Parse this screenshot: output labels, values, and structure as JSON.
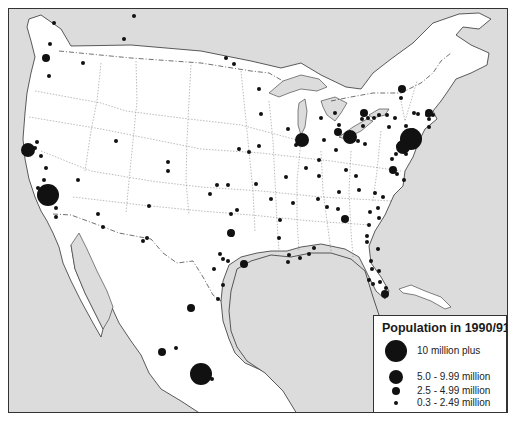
{
  "map": {
    "title": "North America city populations",
    "colors": {
      "water": "#dcdcdc",
      "land": "#ffffff",
      "lakes": "#dcdcdc",
      "city": "#111111",
      "border": "#333333"
    },
    "legend": {
      "title": "Population in 1990/91",
      "items": [
        {
          "label": "10 million plus",
          "radius": 11
        },
        {
          "label": "5.0 - 9.99 million",
          "radius": 7
        },
        {
          "label": "2.5 - 4.99 million",
          "radius": 4
        },
        {
          "label": "0.3 - 2.49 million",
          "radius": 2
        }
      ]
    },
    "cities": [
      {
        "x": 53,
        "y": 22,
        "r": 2
      },
      {
        "x": 49,
        "y": 43,
        "r": 2
      },
      {
        "x": 45,
        "y": 57,
        "r": 4
      },
      {
        "x": 82,
        "y": 62,
        "r": 2
      },
      {
        "x": 48,
        "y": 75,
        "r": 2
      },
      {
        "x": 123,
        "y": 38,
        "r": 2
      },
      {
        "x": 133,
        "y": 15,
        "r": 2
      },
      {
        "x": 233,
        "y": 63,
        "r": 2
      },
      {
        "x": 258,
        "y": 88,
        "r": 2
      },
      {
        "x": 258,
        "y": 145,
        "r": 2
      },
      {
        "x": 27,
        "y": 149,
        "r": 7
      },
      {
        "x": 36,
        "y": 141,
        "r": 2
      },
      {
        "x": 34,
        "y": 147,
        "r": 2
      },
      {
        "x": 40,
        "y": 155,
        "r": 2
      },
      {
        "x": 45,
        "y": 167,
        "r": 2
      },
      {
        "x": 43,
        "y": 179,
        "r": 2
      },
      {
        "x": 37,
        "y": 187,
        "r": 2
      },
      {
        "x": 47,
        "y": 194,
        "r": 11
      },
      {
        "x": 55,
        "y": 207,
        "r": 2
      },
      {
        "x": 55,
        "y": 216,
        "r": 2
      },
      {
        "x": 77,
        "y": 179,
        "r": 2
      },
      {
        "x": 115,
        "y": 140,
        "r": 2
      },
      {
        "x": 167,
        "y": 161,
        "r": 2
      },
      {
        "x": 167,
        "y": 170,
        "r": 2
      },
      {
        "x": 97,
        "y": 213,
        "r": 2
      },
      {
        "x": 102,
        "y": 226,
        "r": 2
      },
      {
        "x": 148,
        "y": 205,
        "r": 2
      },
      {
        "x": 146,
        "y": 237,
        "r": 2
      },
      {
        "x": 142,
        "y": 240,
        "r": 2
      },
      {
        "x": 227,
        "y": 184,
        "r": 2
      },
      {
        "x": 238,
        "y": 148,
        "r": 2
      },
      {
        "x": 248,
        "y": 151,
        "r": 2
      },
      {
        "x": 216,
        "y": 184,
        "r": 2
      },
      {
        "x": 209,
        "y": 193,
        "r": 2
      },
      {
        "x": 230,
        "y": 232,
        "r": 4
      },
      {
        "x": 222,
        "y": 258,
        "r": 2
      },
      {
        "x": 213,
        "y": 268,
        "r": 2
      },
      {
        "x": 243,
        "y": 263,
        "r": 4
      },
      {
        "x": 222,
        "y": 284,
        "r": 2
      },
      {
        "x": 217,
        "y": 298,
        "r": 2
      },
      {
        "x": 190,
        "y": 307,
        "r": 4
      },
      {
        "x": 175,
        "y": 347,
        "r": 2
      },
      {
        "x": 161,
        "y": 351,
        "r": 4
      },
      {
        "x": 200,
        "y": 373,
        "r": 11
      },
      {
        "x": 211,
        "y": 378,
        "r": 2
      },
      {
        "x": 225,
        "y": 57,
        "r": 2
      },
      {
        "x": 260,
        "y": 113,
        "r": 2
      },
      {
        "x": 255,
        "y": 183,
        "r": 2
      },
      {
        "x": 270,
        "y": 198,
        "r": 2
      },
      {
        "x": 285,
        "y": 176,
        "r": 2
      },
      {
        "x": 231,
        "y": 234,
        "r": 2
      },
      {
        "x": 278,
        "y": 237,
        "r": 2
      },
      {
        "x": 295,
        "y": 144,
        "r": 2
      },
      {
        "x": 305,
        "y": 167,
        "r": 2
      },
      {
        "x": 304,
        "y": 140,
        "r": 2
      },
      {
        "x": 301,
        "y": 139,
        "r": 7
      },
      {
        "x": 320,
        "y": 117,
        "r": 2
      },
      {
        "x": 287,
        "y": 128,
        "r": 2
      },
      {
        "x": 323,
        "y": 139,
        "r": 2
      },
      {
        "x": 318,
        "y": 159,
        "r": 2
      },
      {
        "x": 335,
        "y": 149,
        "r": 2
      },
      {
        "x": 334,
        "y": 112,
        "r": 2
      },
      {
        "x": 338,
        "y": 124,
        "r": 2
      },
      {
        "x": 337,
        "y": 131,
        "r": 4
      },
      {
        "x": 349,
        "y": 136,
        "r": 7
      },
      {
        "x": 362,
        "y": 125,
        "r": 2
      },
      {
        "x": 357,
        "y": 140,
        "r": 2
      },
      {
        "x": 364,
        "y": 143,
        "r": 2
      },
      {
        "x": 363,
        "y": 112,
        "r": 4
      },
      {
        "x": 367,
        "y": 117,
        "r": 2
      },
      {
        "x": 361,
        "y": 118,
        "r": 2
      },
      {
        "x": 373,
        "y": 117,
        "r": 2
      },
      {
        "x": 378,
        "y": 114,
        "r": 2
      },
      {
        "x": 386,
        "y": 114,
        "r": 2
      },
      {
        "x": 394,
        "y": 117,
        "r": 2
      },
      {
        "x": 400,
        "y": 97,
        "r": 2
      },
      {
        "x": 401,
        "y": 88,
        "r": 4
      },
      {
        "x": 413,
        "y": 112,
        "r": 2
      },
      {
        "x": 417,
        "y": 113,
        "r": 2
      },
      {
        "x": 426,
        "y": 114,
        "r": 2
      },
      {
        "x": 432,
        "y": 114,
        "r": 2
      },
      {
        "x": 428,
        "y": 126,
        "r": 2
      },
      {
        "x": 405,
        "y": 125,
        "r": 2
      },
      {
        "x": 388,
        "y": 126,
        "r": 2
      },
      {
        "x": 428,
        "y": 112,
        "r": 4
      },
      {
        "x": 428,
        "y": 118,
        "r": 2
      },
      {
        "x": 412,
        "y": 129,
        "r": 2
      },
      {
        "x": 410,
        "y": 138,
        "r": 11
      },
      {
        "x": 402,
        "y": 146,
        "r": 7
      },
      {
        "x": 397,
        "y": 145,
        "r": 2
      },
      {
        "x": 395,
        "y": 153,
        "r": 2
      },
      {
        "x": 391,
        "y": 158,
        "r": 2
      },
      {
        "x": 392,
        "y": 169,
        "r": 4
      },
      {
        "x": 405,
        "y": 153,
        "r": 2
      },
      {
        "x": 396,
        "y": 173,
        "r": 2
      },
      {
        "x": 318,
        "y": 175,
        "r": 2
      },
      {
        "x": 345,
        "y": 169,
        "r": 2
      },
      {
        "x": 355,
        "y": 175,
        "r": 2
      },
      {
        "x": 338,
        "y": 191,
        "r": 2
      },
      {
        "x": 358,
        "y": 189,
        "r": 2
      },
      {
        "x": 374,
        "y": 192,
        "r": 2
      },
      {
        "x": 382,
        "y": 196,
        "r": 2
      },
      {
        "x": 403,
        "y": 179,
        "r": 2
      },
      {
        "x": 344,
        "y": 218,
        "r": 4
      },
      {
        "x": 326,
        "y": 206,
        "r": 2
      },
      {
        "x": 317,
        "y": 198,
        "r": 2
      },
      {
        "x": 337,
        "y": 208,
        "r": 2
      },
      {
        "x": 377,
        "y": 207,
        "r": 2
      },
      {
        "x": 369,
        "y": 211,
        "r": 2
      },
      {
        "x": 368,
        "y": 224,
        "r": 2
      },
      {
        "x": 366,
        "y": 235,
        "r": 2
      },
      {
        "x": 366,
        "y": 241,
        "r": 2
      },
      {
        "x": 378,
        "y": 217,
        "r": 2
      },
      {
        "x": 279,
        "y": 219,
        "r": 2
      },
      {
        "x": 292,
        "y": 202,
        "r": 2
      },
      {
        "x": 288,
        "y": 254,
        "r": 2
      },
      {
        "x": 299,
        "y": 257,
        "r": 2
      },
      {
        "x": 308,
        "y": 253,
        "r": 2
      },
      {
        "x": 313,
        "y": 247,
        "r": 2
      },
      {
        "x": 287,
        "y": 261,
        "r": 2
      },
      {
        "x": 377,
        "y": 248,
        "r": 2
      },
      {
        "x": 370,
        "y": 260,
        "r": 2
      },
      {
        "x": 371,
        "y": 268,
        "r": 2
      },
      {
        "x": 378,
        "y": 270,
        "r": 2
      },
      {
        "x": 372,
        "y": 283,
        "r": 2
      },
      {
        "x": 379,
        "y": 281,
        "r": 2
      },
      {
        "x": 385,
        "y": 287,
        "r": 2
      },
      {
        "x": 384,
        "y": 293,
        "r": 4
      },
      {
        "x": 368,
        "y": 279,
        "r": 2
      },
      {
        "x": 230,
        "y": 213,
        "r": 2
      },
      {
        "x": 236,
        "y": 209,
        "r": 2
      },
      {
        "x": 219,
        "y": 253,
        "r": 2
      },
      {
        "x": 227,
        "y": 260,
        "r": 2
      }
    ]
  }
}
